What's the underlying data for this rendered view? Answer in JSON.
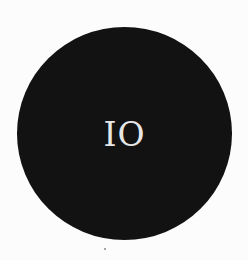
{
  "badge": {
    "text": "IO",
    "background_color": "#121212",
    "text_color": "#e6e6e6",
    "shape": "circle"
  },
  "page": {
    "background_color": "#fcfcfc"
  }
}
